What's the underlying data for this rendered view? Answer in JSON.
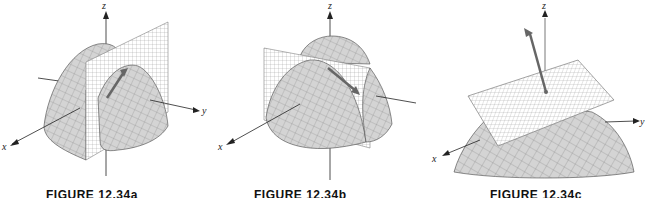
{
  "figures": [
    {
      "id": "a",
      "caption": "FIGURE 12.34a",
      "description": "Paraboloid cut by vertical plane through z-axis, with tangent arrow",
      "axes": {
        "x": "x",
        "y": "y",
        "z": "z"
      }
    },
    {
      "id": "b",
      "caption": "FIGURE 12.34b",
      "description": "Paraboloid cut by slanted vertical plane, with tangent arrow along curve",
      "axes": {
        "x": "x",
        "y": "y",
        "z": "z"
      }
    },
    {
      "id": "c",
      "caption": "FIGURE 12.34c",
      "description": "Surface with tangent plane and normal vector",
      "axes": {
        "x": "x",
        "y": "y",
        "z": "z"
      }
    }
  ],
  "colors": {
    "surface_fill": "#d9d9d9",
    "mesh_line": "#555555",
    "plane_fill": "#ffffff",
    "plane_grid": "#777777",
    "arrow": "#666666",
    "axis": "#222222"
  }
}
